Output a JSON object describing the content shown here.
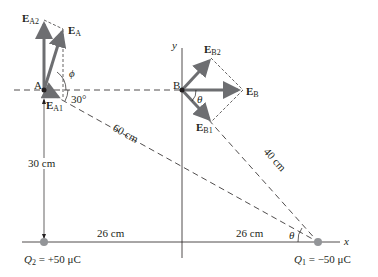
{
  "diagram": {
    "points": {
      "A": {
        "label": "A"
      },
      "B": {
        "label": "B"
      }
    },
    "vectors": {
      "EA2": {
        "main": "E",
        "sub": "A2"
      },
      "EA": {
        "main": "E",
        "sub": "A"
      },
      "EA1": {
        "main": "E",
        "sub": "A1"
      },
      "EB2": {
        "main": "E",
        "sub": "B2"
      },
      "EB": {
        "main": "E",
        "sub": "B"
      },
      "EB1": {
        "main": "E",
        "sub": "B1"
      }
    },
    "angles": {
      "phi": "ϕ",
      "thirty": "30°",
      "theta_B": "θ",
      "theta_Q1": "θ"
    },
    "distances": {
      "AQ1": "60 cm",
      "BQ1": "40 cm",
      "AQ2": "30 cm",
      "Q2_origin": "26 cm",
      "origin_Q1": "26 cm"
    },
    "axes": {
      "x": "x",
      "y": "y"
    },
    "charges": {
      "Q2": {
        "symbol": "Q",
        "sub": "2",
        "value": " = +50 μC"
      },
      "Q1": {
        "symbol": "Q",
        "sub": "1",
        "value": " = −50 μC"
      }
    },
    "colors": {
      "vector": "#6d6e71",
      "line": "#231f20",
      "charge": "#939598"
    }
  }
}
